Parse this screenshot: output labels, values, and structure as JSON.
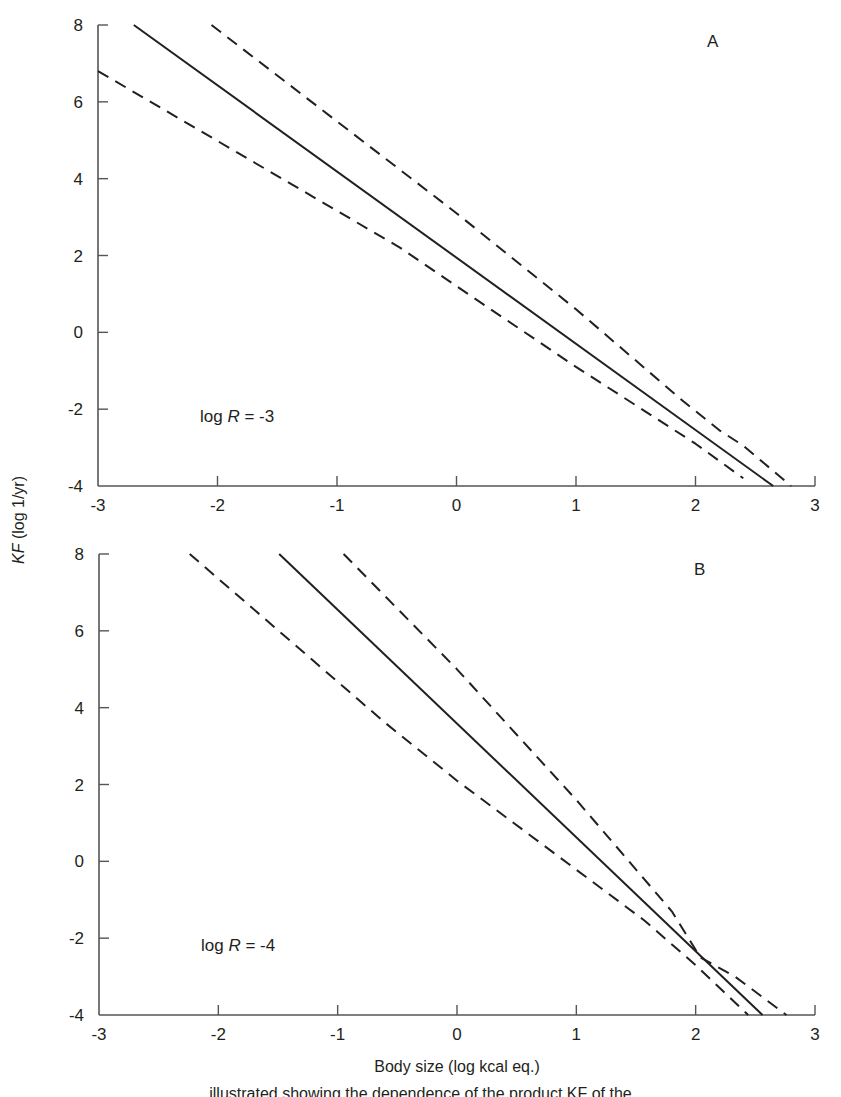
{
  "figure": {
    "y_axis_title": "KF (log 1/yr)",
    "y_axis_title_italic_part": "KF",
    "y_axis_title_rest": " (log 1/yr)",
    "x_axis_title": "Body size (log kcal eq.)",
    "caption_fragment": "…illustrated showing the dependence of the product KF of the…",
    "colors": {
      "ink": "#231f20",
      "background": "#ffffff"
    }
  },
  "chart_data": [
    {
      "type": "line",
      "panel": "A",
      "title": "",
      "annotation": "log R = -3",
      "annotation_prefix": "log ",
      "annotation_var": "R",
      "annotation_suffix": " = -3",
      "xlabel": "Body size (log kcal eq.)",
      "ylabel": "KF (log 1/yr)",
      "xlim": [
        -3,
        3
      ],
      "ylim": [
        -4,
        8
      ],
      "xticks": [
        -3,
        -2,
        -1,
        0,
        1,
        2,
        3
      ],
      "yticks": [
        -4,
        -2,
        0,
        2,
        4,
        6,
        8
      ],
      "grid": false,
      "legend": null,
      "series": [
        {
          "name": "estimate",
          "style": "solid",
          "x": [
            -2.7,
            2.65
          ],
          "y": [
            8,
            -4
          ]
        },
        {
          "name": "upper bound",
          "style": "dashed",
          "x": [
            -2.05,
            0,
            1.0,
            1.9,
            2.2,
            2.4,
            2.8
          ],
          "y": [
            8,
            3.1,
            0.6,
            -1.8,
            -2.55,
            -2.95,
            -4
          ]
        },
        {
          "name": "lower bound",
          "style": "dashed",
          "x": [
            -3,
            -0.47,
            0,
            1.0,
            2.0,
            2.4
          ],
          "y": [
            6.8,
            2.2,
            1.2,
            -0.9,
            -2.9,
            -3.8
          ]
        }
      ]
    },
    {
      "type": "line",
      "panel": "B",
      "title": "",
      "annotation": "log R = -4",
      "annotation_prefix": "log ",
      "annotation_var": "R",
      "annotation_suffix": " = -4",
      "xlabel": "Body size (log kcal eq.)",
      "ylabel": "KF (log 1/yr)",
      "xlim": [
        -3,
        3
      ],
      "ylim": [
        -4,
        8
      ],
      "xticks": [
        -3,
        -2,
        -1,
        0,
        1,
        2,
        3
      ],
      "yticks": [
        -4,
        -2,
        0,
        2,
        4,
        6,
        8
      ],
      "grid": false,
      "legend": null,
      "series": [
        {
          "name": "estimate",
          "style": "solid",
          "x": [
            -1.49,
            2.56
          ],
          "y": [
            8,
            -4
          ]
        },
        {
          "name": "upper bound",
          "style": "dashed",
          "x": [
            -0.95,
            0,
            1.0,
            1.8,
            2.04,
            2.33,
            2.76
          ],
          "y": [
            8,
            5.0,
            1.6,
            -1.3,
            -2.5,
            -3.0,
            -4
          ]
        },
        {
          "name": "lower bound",
          "style": "dashed",
          "x": [
            -2.24,
            -0.6,
            0,
            1.57,
            2.0,
            2.44
          ],
          "y": [
            8,
            3.6,
            2.1,
            -1.54,
            -2.7,
            -4
          ]
        }
      ]
    }
  ],
  "layout": {
    "panels": [
      {
        "letter": "A",
        "x0px": 98,
        "x1px": 815,
        "ytop": 25,
        "ybot": 486,
        "letter_pos": [
          707,
          47
        ],
        "annot_pos": [
          200,
          422
        ]
      },
      {
        "letter": "B",
        "x0px": 99,
        "x1px": 815,
        "ytop": 554,
        "ybot": 1015,
        "letter_pos": [
          694,
          575
        ],
        "annot_pos": [
          201,
          951
        ]
      }
    ],
    "y_title_pos": [
      24,
      520
    ],
    "x_title_pos": [
      457,
      1072
    ]
  }
}
